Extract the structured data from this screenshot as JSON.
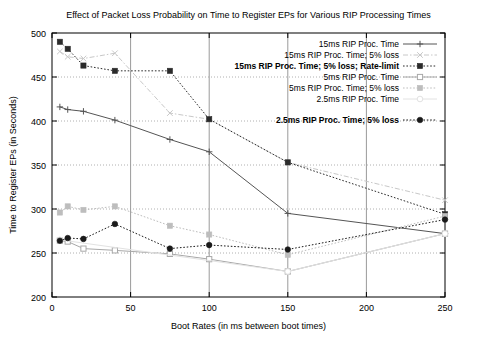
{
  "chart_data": {
    "type": "line",
    "title": "Effect of Packet Loss Probability on Time to Register EPs for Various RIP Processing Times",
    "xlabel": "Boot Rates (in ms between boot times)",
    "ylabel": "Time to Register EPs (in Seconds)",
    "xlim": [
      0,
      250
    ],
    "ylim": [
      200,
      500
    ],
    "xticks": [
      0,
      50,
      100,
      150,
      200,
      250
    ],
    "yticks": [
      200,
      250,
      300,
      350,
      400,
      450,
      500
    ],
    "grid": true,
    "legend_position": "top-right",
    "series": [
      {
        "name": "15ms RIP Proc. Time",
        "marker": "plus",
        "dash": "solid",
        "color": "#555555",
        "x": [
          5,
          10,
          20,
          40,
          75,
          100,
          150,
          250
        ],
        "y": [
          416,
          413,
          411,
          401,
          379,
          365,
          295,
          272
        ]
      },
      {
        "name": "15ms RIP Proc. Time; 5% loss",
        "marker": "cross",
        "dash": "dashdot",
        "color": "#c8c8c8",
        "x": [
          5,
          10,
          20,
          40,
          75,
          100,
          150,
          250
        ],
        "y": [
          479,
          473,
          471,
          477,
          409,
          402,
          353,
          310
        ]
      },
      {
        "name": "15ms RIP Proc. Time; 5% loss; Rate-limit",
        "marker": "filled-square",
        "dash": "dotted",
        "color": "#2b2b2b",
        "x": [
          5,
          10,
          20,
          40,
          75,
          100,
          150,
          250
        ],
        "y": [
          490,
          482,
          463,
          457,
          457,
          402,
          353,
          294
        ]
      },
      {
        "name": "5ms RIP Proc. Time",
        "marker": "open-square",
        "dash": "solid",
        "color": "#a8a8a8",
        "x": [
          5,
          10,
          20,
          40,
          75,
          100,
          150,
          250
        ],
        "y": [
          264,
          263,
          255,
          253,
          249,
          243,
          229,
          272
        ]
      },
      {
        "name": "5ms RIP Proc. Time; 5% loss",
        "marker": "filled-square",
        "dash": "dotted",
        "color": "#bdbdbd",
        "x": [
          5,
          10,
          20,
          40,
          75,
          100,
          150,
          250
        ],
        "y": [
          296,
          303,
          299,
          303,
          281,
          271,
          248,
          292
        ]
      },
      {
        "name": "2.5ms RIP Proc. Time",
        "marker": "open-circle",
        "dash": "solid",
        "color": "#e2e2e2",
        "x": [
          5,
          150,
          250
        ],
        "y": [
          265,
          229,
          272
        ]
      },
      {
        "name": "2.5ms RIP Proc. Time; 5% loss",
        "marker": "filled-circle",
        "dash": "dotted",
        "color": "#1a1a1a",
        "x": [
          5,
          10,
          20,
          40,
          75,
          100,
          150,
          250
        ],
        "y": [
          264,
          267,
          266,
          283,
          255,
          259,
          254,
          288
        ]
      }
    ]
  }
}
